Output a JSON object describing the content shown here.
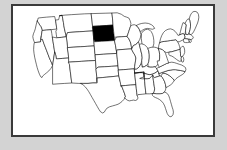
{
  "figure": {
    "kind": "choropleth-map",
    "region": "United States (contiguous 48 states)",
    "title": "",
    "frame_border_color": "#3a3a3a",
    "page_background_color": "#d3d3d3",
    "map_background_color": "#ffffff",
    "state_outline_color": "#000000",
    "highlight_color": "#000000",
    "default_state_fill": "#ffffff",
    "highlighted_states": [
      "South Dakota"
    ],
    "legend": [],
    "annotations": []
  },
  "states": [
    {
      "code": "WA",
      "name": "Washington",
      "highlighted": false
    },
    {
      "code": "OR",
      "name": "Oregon",
      "highlighted": false
    },
    {
      "code": "CA",
      "name": "California",
      "highlighted": false
    },
    {
      "code": "NV",
      "name": "Nevada",
      "highlighted": false
    },
    {
      "code": "ID",
      "name": "Idaho",
      "highlighted": false
    },
    {
      "code": "MT",
      "name": "Montana",
      "highlighted": false
    },
    {
      "code": "WY",
      "name": "Wyoming",
      "highlighted": false
    },
    {
      "code": "UT",
      "name": "Utah",
      "highlighted": false
    },
    {
      "code": "AZ",
      "name": "Arizona",
      "highlighted": false
    },
    {
      "code": "CO",
      "name": "Colorado",
      "highlighted": false
    },
    {
      "code": "NM",
      "name": "New Mexico",
      "highlighted": false
    },
    {
      "code": "ND",
      "name": "North Dakota",
      "highlighted": false
    },
    {
      "code": "SD",
      "name": "South Dakota",
      "highlighted": true
    },
    {
      "code": "NE",
      "name": "Nebraska",
      "highlighted": false
    },
    {
      "code": "KS",
      "name": "Kansas",
      "highlighted": false
    },
    {
      "code": "OK",
      "name": "Oklahoma",
      "highlighted": false
    },
    {
      "code": "TX",
      "name": "Texas",
      "highlighted": false
    },
    {
      "code": "MN",
      "name": "Minnesota",
      "highlighted": false
    },
    {
      "code": "IA",
      "name": "Iowa",
      "highlighted": false
    },
    {
      "code": "MO",
      "name": "Missouri",
      "highlighted": false
    },
    {
      "code": "AR",
      "name": "Arkansas",
      "highlighted": false
    },
    {
      "code": "LA",
      "name": "Louisiana",
      "highlighted": false
    },
    {
      "code": "WI",
      "name": "Wisconsin",
      "highlighted": false
    },
    {
      "code": "IL",
      "name": "Illinois",
      "highlighted": false
    },
    {
      "code": "MS",
      "name": "Mississippi",
      "highlighted": false
    },
    {
      "code": "MI",
      "name": "Michigan",
      "highlighted": false
    },
    {
      "code": "IN",
      "name": "Indiana",
      "highlighted": false
    },
    {
      "code": "OH",
      "name": "Ohio",
      "highlighted": false
    },
    {
      "code": "KY",
      "name": "Kentucky",
      "highlighted": false
    },
    {
      "code": "TN",
      "name": "Tennessee",
      "highlighted": false
    },
    {
      "code": "AL",
      "name": "Alabama",
      "highlighted": false
    },
    {
      "code": "GA",
      "name": "Georgia",
      "highlighted": false
    },
    {
      "code": "FL",
      "name": "Florida",
      "highlighted": false
    },
    {
      "code": "SC",
      "name": "South Carolina",
      "highlighted": false
    },
    {
      "code": "NC",
      "name": "North Carolina",
      "highlighted": false
    },
    {
      "code": "VA",
      "name": "Virginia",
      "highlighted": false
    },
    {
      "code": "WV",
      "name": "West Virginia",
      "highlighted": false
    },
    {
      "code": "PA",
      "name": "Pennsylvania",
      "highlighted": false
    },
    {
      "code": "NY",
      "name": "New York",
      "highlighted": false
    },
    {
      "code": "VT",
      "name": "Vermont",
      "highlighted": false
    },
    {
      "code": "NH",
      "name": "New Hampshire",
      "highlighted": false
    },
    {
      "code": "ME",
      "name": "Maine",
      "highlighted": false
    },
    {
      "code": "MA",
      "name": "Massachusetts",
      "highlighted": false
    },
    {
      "code": "RI",
      "name": "Rhode Island",
      "highlighted": false
    },
    {
      "code": "CT",
      "name": "Connecticut",
      "highlighted": false
    },
    {
      "code": "NJ",
      "name": "New Jersey",
      "highlighted": false
    },
    {
      "code": "DE",
      "name": "Delaware",
      "highlighted": false
    },
    {
      "code": "MD",
      "name": "Maryland",
      "highlighted": false
    }
  ]
}
